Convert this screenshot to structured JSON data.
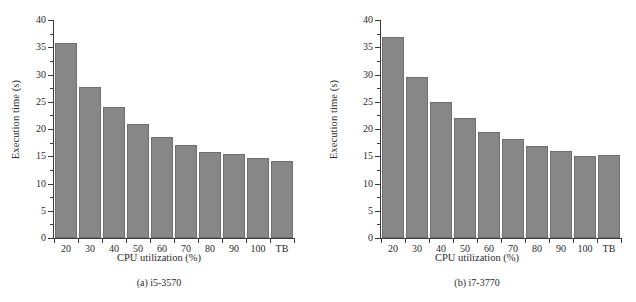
{
  "figure": {
    "background": "#ffffff",
    "bar_color": "#878787",
    "bar_edge_color": "#6f6f6f",
    "axis_color": "#3a3a3a"
  },
  "chart_data": [
    {
      "type": "bar",
      "title": "",
      "panel_tag": "(a)",
      "panel_name": "i5-3570",
      "caption": "(a)  i5-3570",
      "xlabel": "CPU utilization (%)",
      "ylabel": "Execution time (s)",
      "categories": [
        "20",
        "30",
        "40",
        "50",
        "60",
        "70",
        "80",
        "90",
        "100",
        "TB"
      ],
      "values": [
        35.8,
        27.8,
        24.0,
        21.0,
        18.5,
        17.1,
        15.8,
        15.4,
        14.6,
        14.2
      ],
      "ylim": [
        0,
        40
      ],
      "yticks": [
        0,
        5,
        10,
        15,
        20,
        25,
        30,
        35,
        40
      ],
      "ytick_labels": [
        "0",
        "5",
        "10",
        "15",
        "20",
        "25",
        "30",
        "35",
        "40"
      ],
      "grid": false,
      "legend": "none"
    },
    {
      "type": "bar",
      "title": "",
      "panel_tag": "(b)",
      "panel_name": "i7-3770",
      "caption": "(b)  i7-3770",
      "xlabel": "CPU utilization (%)",
      "ylabel": "Execution time (s)",
      "categories": [
        "20",
        "30",
        "40",
        "50",
        "60",
        "70",
        "80",
        "90",
        "100",
        "TB"
      ],
      "values": [
        36.8,
        29.5,
        25.0,
        22.1,
        19.4,
        18.2,
        16.8,
        15.9,
        15.1,
        15.3
      ],
      "ylim": [
        0,
        40
      ],
      "yticks": [
        0,
        5,
        10,
        15,
        20,
        25,
        30,
        35,
        40
      ],
      "ytick_labels": [
        "0",
        "5",
        "10",
        "15",
        "20",
        "25",
        "30",
        "35",
        "40"
      ],
      "grid": false,
      "legend": "none"
    }
  ]
}
